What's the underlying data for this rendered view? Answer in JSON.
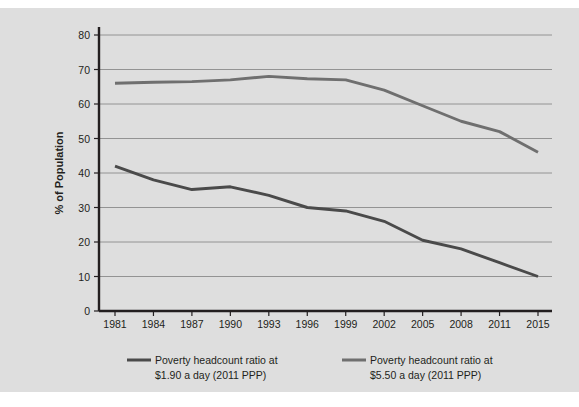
{
  "figure": {
    "background_color": "#dedede",
    "page_background_color": "#ffffff"
  },
  "axis": {
    "ylabel": "% of Population",
    "y_ticks": [
      "0",
      "10",
      "20",
      "30",
      "40",
      "50",
      "60",
      "70",
      "80"
    ],
    "x_ticks": [
      "1981",
      "1984",
      "1987",
      "1990",
      "1993",
      "1996",
      "1999",
      "2002",
      "2005",
      "2008",
      "2011",
      "2015"
    ]
  },
  "legend": {
    "items": [
      {
        "line1": "Poverty headcount ratio at",
        "line2": "$1.90 a day (2011 PPP)",
        "color": "#4a4a4a"
      },
      {
        "line1": "Poverty headcount ratio at",
        "line2": "$5.50 a day (2011 PPP)",
        "color": "#6f6f6f"
      }
    ]
  },
  "chart_data": {
    "type": "line",
    "title": "",
    "xlabel": "",
    "ylabel": "% of Population",
    "xlim": [
      1981,
      2015
    ],
    "ylim": [
      0,
      80
    ],
    "ytick_step": 10,
    "grid": true,
    "legend_position": "bottom",
    "x": [
      1981,
      1984,
      1987,
      1990,
      1993,
      1996,
      1999,
      2002,
      2005,
      2008,
      2011,
      2015
    ],
    "categories": [
      "1981",
      "1984",
      "1987",
      "1990",
      "1993",
      "1996",
      "1999",
      "2002",
      "2005",
      "2008",
      "2011",
      "2015"
    ],
    "series": [
      {
        "name": "Poverty headcount ratio at $1.90 a day (2011 PPP)",
        "color": "#4a4a4a",
        "values": [
          42.0,
          38.0,
          35.2,
          36.0,
          33.5,
          30.0,
          29.0,
          26.0,
          20.5,
          18.0,
          14.0,
          10.0
        ]
      },
      {
        "name": "Poverty headcount ratio at $5.50 a day (2011 PPP)",
        "color": "#6f6f6f",
        "values": [
          66.0,
          66.3,
          66.5,
          67.0,
          68.0,
          67.3,
          67.0,
          64.0,
          59.5,
          55.0,
          52.0,
          46.0
        ]
      }
    ]
  }
}
